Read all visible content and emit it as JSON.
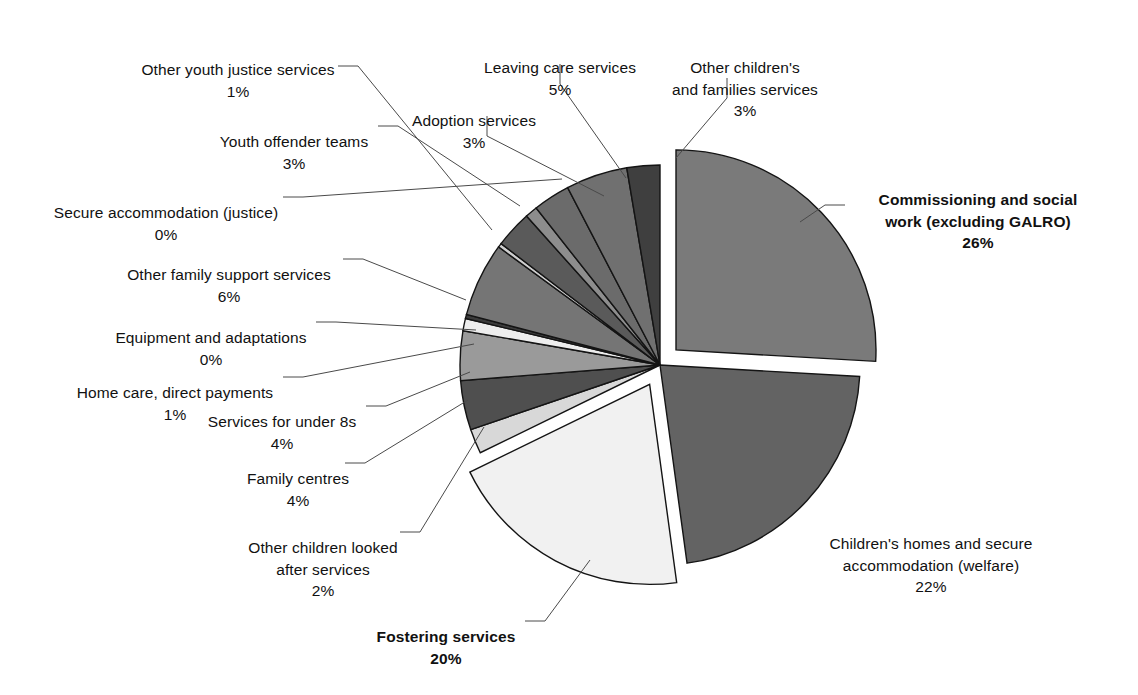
{
  "chart_data": {
    "type": "pie",
    "title": "",
    "subtitle": "",
    "xlabel": "",
    "ylabel": "",
    "legend_position": "none",
    "grid": false,
    "value_unit": "%",
    "categories": [
      "Commissioning and social work (excluding GALRO)",
      "Children's homes and secure accommodation (welfare)",
      "Fostering services",
      "Other children looked after services",
      "Family centres",
      "Services for under 8s",
      "Home care, direct payments",
      "Equipment and adaptations",
      "Other family support services",
      "Secure accommodation (justice)",
      "Youth offender teams",
      "Other youth justice services",
      "Adoption services",
      "Leaving care services",
      "Other children's and families services"
    ],
    "values": [
      26,
      22,
      20,
      2,
      4,
      4,
      1,
      0,
      6,
      0,
      3,
      1,
      3,
      5,
      3
    ],
    "slice_colors": [
      "#7a7a7a",
      "#636363",
      "#f1f1f1",
      "#d8d8d8",
      "#4f4f4f",
      "#9a9a9a",
      "#ededed",
      "#3b3b3b",
      "#757575",
      "#cfcfcf",
      "#5a5a5a",
      "#8d8d8d",
      "#6b6b6b",
      "#707070",
      "#3f3f3f"
    ],
    "exploded": [
      true,
      false,
      true,
      false,
      false,
      false,
      false,
      false,
      false,
      false,
      false,
      false,
      false,
      false,
      false
    ]
  },
  "labels": [
    {
      "name": "other-youth-justice-services",
      "text": "Other youth justice services",
      "percent": "1%",
      "bold": false,
      "align": "center"
    },
    {
      "name": "leaving-care-services",
      "text": "Leaving care services",
      "percent": "5%",
      "bold": false,
      "align": "center"
    },
    {
      "name": "other-childrens-and-families-services",
      "text": "Other children's\nand families services",
      "percent": "3%",
      "bold": false,
      "align": "center"
    },
    {
      "name": "adoption-services",
      "text": "Adoption services",
      "percent": "3%",
      "bold": false,
      "align": "center"
    },
    {
      "name": "youth-offender-teams",
      "text": "Youth offender teams",
      "percent": "3%",
      "bold": false,
      "align": "center"
    },
    {
      "name": "secure-accommodation-justice",
      "text": "Secure accommodation (justice)",
      "percent": "0%",
      "bold": false,
      "align": "center"
    },
    {
      "name": "other-family-support-services",
      "text": "Other family support services",
      "percent": "6%",
      "bold": false,
      "align": "center"
    },
    {
      "name": "equipment-and-adaptations",
      "text": "Equipment and adaptations",
      "percent": "0%",
      "bold": false,
      "align": "center"
    },
    {
      "name": "home-care-direct-payments",
      "text": "Home care, direct payments",
      "percent": "1%",
      "bold": false,
      "align": "center"
    },
    {
      "name": "services-for-under-8s",
      "text": "Services for under 8s",
      "percent": "4%",
      "bold": false,
      "align": "center"
    },
    {
      "name": "family-centres",
      "text": "Family centres",
      "percent": "4%",
      "bold": false,
      "align": "center"
    },
    {
      "name": "other-children-looked-after-services",
      "text": "Other children looked\nafter services",
      "percent": "2%",
      "bold": false,
      "align": "center"
    },
    {
      "name": "fostering-services",
      "text": "Fostering services",
      "percent": "20%",
      "bold": true,
      "align": "center"
    },
    {
      "name": "commissioning-and-social-work",
      "text": "Commissioning and social\nwork (excluding GALRO)",
      "percent": "26%",
      "bold": true,
      "align": "center"
    },
    {
      "name": "childrens-homes-and-secure-accommodation",
      "text": "Children's homes and secure\naccommodation (welfare)",
      "percent": "22%",
      "bold": false,
      "align": "center"
    }
  ]
}
